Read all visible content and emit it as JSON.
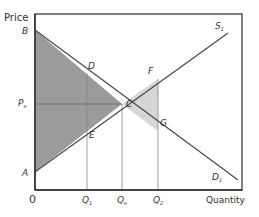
{
  "diagram": {
    "type": "supply-demand-surplus",
    "axis_labels": {
      "y": "Price",
      "x": "Quantity",
      "origin": "0"
    },
    "curves": {
      "supply": "S",
      "supply_sub": "1",
      "demand": "D",
      "demand_sub": "1"
    },
    "points": {
      "B": "B",
      "A": "A",
      "D": "D",
      "E": "E",
      "C": "C",
      "F": "F",
      "G": "G"
    },
    "price_labels": {
      "pe": "P",
      "pe_sub": "e"
    },
    "quantity_labels": {
      "q1": "Q",
      "q1_sub": "1",
      "qe": "Q",
      "qe_sub": "e",
      "q2": "Q",
      "q2_sub": "2"
    },
    "colors": {
      "dark_area": "#9b9b9b",
      "light_area": "#d6d6d6",
      "line": "#444444",
      "frame": "#555555"
    }
  }
}
